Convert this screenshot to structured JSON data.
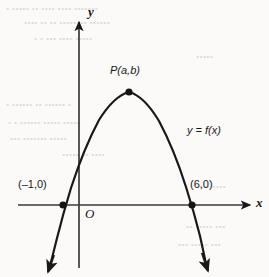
{
  "figure": {
    "background_color": "#fbfaf8",
    "ink_color": "#191919",
    "bleed_color": "#d9d6d2"
  },
  "axes": {
    "x_axis_label": "x",
    "y_axis_label": "y",
    "origin_label": "O",
    "x_axis_pixel_y": 205,
    "y_axis_pixel_x": 79,
    "units_per_pixel": 18.4,
    "x_axis_arrow": true,
    "y_axis_arrow": true,
    "tick_marks": false,
    "grid": false
  },
  "labels": {
    "vertex": "P(a,b)",
    "curve": "y = f(x)",
    "left_intercept": "(–1,0)",
    "right_intercept": "(6,0)"
  },
  "chart_data": {
    "type": "line",
    "title": "",
    "subtitle": "",
    "xlabel": "x",
    "ylabel": "y",
    "grid": false,
    "legend_position": "inline-curve-label",
    "xlim": [
      -2.2,
      9.2
    ],
    "ylim": [
      -4.5,
      8.2
    ],
    "series": [
      {
        "name": "y = f(x)",
        "shape": "parabola",
        "opens": "downward",
        "roots": [
          -1,
          6
        ],
        "vertex": {
          "x": 2.5,
          "y": 6.1,
          "label": "P(a,b)"
        },
        "y_intercept": 3.0,
        "equation_form": "y = a(x + 1)(x - 6), a < 0",
        "x": [
          -1.6,
          -1.0,
          0.0,
          1.0,
          2.0,
          2.5,
          3.0,
          4.0,
          5.0,
          6.0,
          6.9
        ],
        "y": [
          -3.0,
          0.0,
          3.5,
          5.4,
          6.0,
          6.1,
          6.0,
          5.0,
          3.2,
          0.0,
          -3.2
        ]
      }
    ],
    "points": [
      {
        "label": "(–1,0)",
        "x": -1,
        "y": 0,
        "marker": "filled-dot"
      },
      {
        "label": "P(a,b)",
        "x": 2.5,
        "y": 6.1,
        "marker": "filled-dot"
      },
      {
        "label": "(6,0)",
        "x": 6,
        "y": 0,
        "marker": "filled-dot"
      }
    ],
    "annotations": [
      {
        "text": "y = f(x)",
        "x": 7.0,
        "y": 3.0
      },
      {
        "text": "O",
        "x": 0.35,
        "y": -0.9
      }
    ]
  },
  "bleed_text": {
    "note": "faint show-through text from reverse page, illegible",
    "lines": [
      {
        "text": "•   •••••  •• •••• •••• •••••••",
        "x": 6,
        "y": 4
      },
      {
        "text": "••••  •• •• •••••••• ••••••",
        "x": 24,
        "y": 18
      },
      {
        "text": "•  • ••• •••• •••••",
        "x": 34,
        "y": 34
      },
      {
        "text": "•••••",
        "x": 196,
        "y": 52
      },
      {
        "text": "•   •••••• •• •••••• •",
        "x": 6,
        "y": 100
      },
      {
        "text": "• • •••••• ••••• •••••",
        "x": 8,
        "y": 118
      },
      {
        "text": "••• ••••••• •••••",
        "x": 10,
        "y": 134
      },
      {
        "text": "••••• •• ••••",
        "x": 62,
        "y": 150
      },
      {
        "text": "•••• ••••",
        "x": 196,
        "y": 182
      },
      {
        "text": "•• ••••• •••",
        "x": 186,
        "y": 222
      },
      {
        "text": "••• ••••• •••",
        "x": 178,
        "y": 240
      }
    ]
  }
}
